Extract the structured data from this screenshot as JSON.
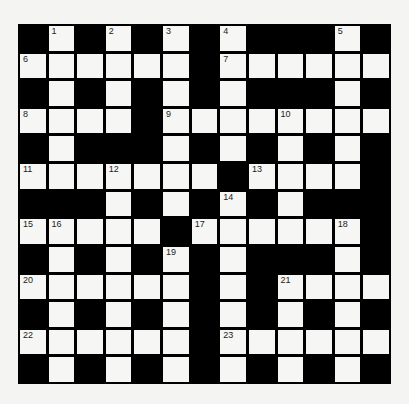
{
  "puzzle": {
    "rows": 13,
    "cols": 13,
    "colors": {
      "block": "#000000",
      "cell": "#f6f6f4",
      "number": "#222222"
    },
    "grid": [
      "#.#.#.#.###.#",
      "......#......",
      "#.#.#.#.###.#",
      "....#........",
      "#.###.#.#.#.#",
      ".......#....#",
      "###.#.#.#.###",
      ".....#......#",
      "#.#.#.#.###.#",
      "......#.#....",
      "#.#.#.#.#.#.#",
      "......#......",
      "#.#.#.#.#.#.#"
    ],
    "numbers": [
      {
        "r": 0,
        "c": 1,
        "n": "1"
      },
      {
        "r": 0,
        "c": 3,
        "n": "2"
      },
      {
        "r": 0,
        "c": 5,
        "n": "3"
      },
      {
        "r": 0,
        "c": 7,
        "n": "4"
      },
      {
        "r": 0,
        "c": 11,
        "n": "5"
      },
      {
        "r": 1,
        "c": 0,
        "n": "6"
      },
      {
        "r": 1,
        "c": 7,
        "n": "7"
      },
      {
        "r": 3,
        "c": 0,
        "n": "8"
      },
      {
        "r": 3,
        "c": 5,
        "n": "9"
      },
      {
        "r": 3,
        "c": 9,
        "n": "10"
      },
      {
        "r": 5,
        "c": 0,
        "n": "11"
      },
      {
        "r": 5,
        "c": 3,
        "n": "12"
      },
      {
        "r": 5,
        "c": 8,
        "n": "13"
      },
      {
        "r": 6,
        "c": 7,
        "n": "14"
      },
      {
        "r": 7,
        "c": 0,
        "n": "15"
      },
      {
        "r": 7,
        "c": 1,
        "n": "16"
      },
      {
        "r": 7,
        "c": 6,
        "n": "17"
      },
      {
        "r": 7,
        "c": 11,
        "n": "18"
      },
      {
        "r": 8,
        "c": 5,
        "n": "19"
      },
      {
        "r": 9,
        "c": 0,
        "n": "20"
      },
      {
        "r": 9,
        "c": 9,
        "n": "21"
      },
      {
        "r": 11,
        "c": 0,
        "n": "22"
      },
      {
        "r": 11,
        "c": 7,
        "n": "23"
      }
    ]
  }
}
